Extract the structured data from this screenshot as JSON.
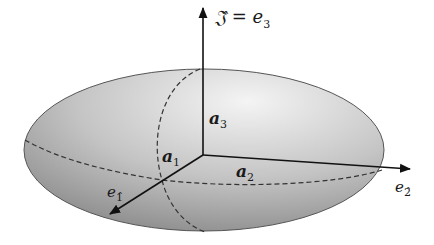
{
  "diagram": {
    "type": "ellipsoid-principal-axes",
    "labels": {
      "top_axis": "𝔍̂ = e₃",
      "top_axis_base": "𝔍̂ = e",
      "top_axis_sub": "3",
      "e1_base": "e",
      "e1_sub": "1̂",
      "e2_base": "e",
      "e2_sub": "2̂",
      "a1_base": "a",
      "a1_sub": "1",
      "a2_base": "a",
      "a2_sub": "2",
      "a3_base": "a",
      "a3_sub": "3"
    },
    "colors": {
      "fill_light": "#f2f2f2",
      "fill_dark": "#8a8a8a",
      "stroke": "#222222"
    }
  }
}
